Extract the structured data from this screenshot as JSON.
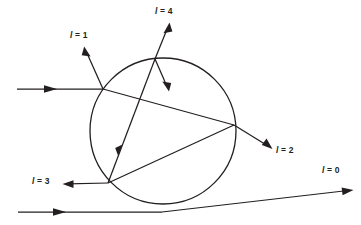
{
  "figure": {
    "background_color": "#ffffff",
    "stroke_color": "#231f20",
    "width": 361,
    "height": 225
  },
  "circle": {
    "center_x": 163,
    "center_y": 131,
    "radius": 73,
    "label": "circle-boundary"
  },
  "labels": {
    "l0": {
      "var": "l",
      "eq": " = ",
      "value": "0",
      "full": "l = 0",
      "x": 322,
      "y": 166
    },
    "l1": {
      "var": "l",
      "eq": " = ",
      "value": "1",
      "full": "l = 1",
      "x": 70,
      "y": 31
    },
    "l2": {
      "var": "l",
      "eq": " = ",
      "value": "2",
      "full": "l = 2",
      "x": 276,
      "y": 146
    },
    "l3": {
      "var": "l",
      "eq": " = ",
      "value": "3",
      "full": "l = 3",
      "x": 32,
      "y": 177
    },
    "l4": {
      "var": "l",
      "eq": " = ",
      "value": "4",
      "full": "l = 4",
      "x": 155,
      "y": 7
    }
  },
  "rays": [
    {
      "name": "incoming-upper-ray",
      "description": "horizontal incoming ray from left striking circle",
      "x1": 17,
      "y1": 89,
      "x2": 103,
      "y2": 89,
      "arrow_at": "mid"
    },
    {
      "name": "reflected-ray-l1",
      "description": "reflected ray leaving upper-left toward l = 1",
      "x1": 103,
      "y1": 89,
      "x2": 85,
      "y2": 49,
      "arrow_at": "end"
    },
    {
      "name": "chord-upper-to-right",
      "description": "chord from upper-left entry point to right exit point",
      "x1": 103,
      "y1": 89,
      "x2": 234,
      "y2": 125,
      "arrow_at": "none"
    },
    {
      "name": "refracted-ray-l2",
      "description": "ray exiting right side toward l = 2",
      "x1": 234,
      "y1": 125,
      "x2": 271,
      "y2": 148,
      "arrow_at": "end"
    },
    {
      "name": "chord-right-to-lower-left",
      "description": "chord from right exit point down to lower-left vertex",
      "x1": 234,
      "y1": 125,
      "x2": 108,
      "y2": 183,
      "arrow_at": "none"
    },
    {
      "name": "refracted-ray-l3",
      "description": "ray exiting lower-left toward l = 3",
      "x1": 108,
      "y1": 183,
      "x2": 64,
      "y2": 184,
      "arrow_at": "end"
    },
    {
      "name": "chord-lower-left-to-top",
      "description": "chord from lower-left vertex up to top intersection",
      "x1": 108,
      "y1": 183,
      "x2": 155,
      "y2": 59,
      "arrow_at": "mid"
    },
    {
      "name": "refracted-ray-l4",
      "description": "ray exiting top of circle toward l = 4",
      "x1": 155,
      "y1": 59,
      "x2": 169,
      "y2": 24,
      "arrow_at": "end"
    },
    {
      "name": "internal-ray-down-right",
      "description": "short internal ray from top intersection heading down-right",
      "x1": 155,
      "y1": 59,
      "x2": 169,
      "y2": 91,
      "arrow_at": "end"
    },
    {
      "name": "incoming-lower-ray",
      "description": "horizontal incoming ray along bottom",
      "x1": 18,
      "y1": 212,
      "x2": 162,
      "y2": 212,
      "arrow_at": "mid"
    },
    {
      "name": "outgoing-ray-l0",
      "description": "ray deflecting up-right toward l = 0",
      "x1": 162,
      "y1": 212,
      "x2": 352,
      "y2": 190,
      "arrow_at": "end"
    }
  ]
}
